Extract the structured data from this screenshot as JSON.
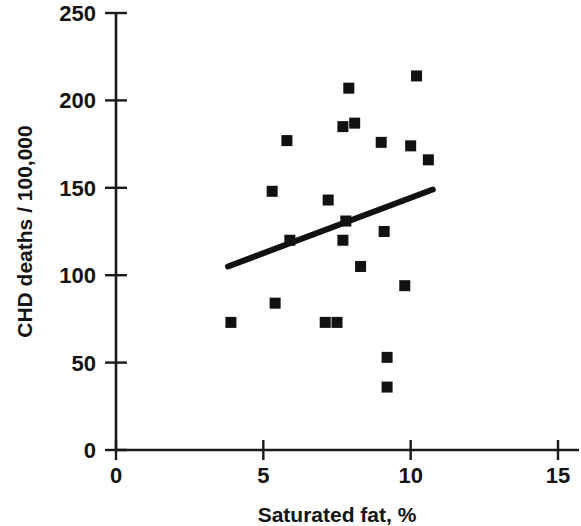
{
  "chart_data": {
    "type": "scatter",
    "title": "",
    "xlabel": "Saturated fat, %",
    "ylabel": "CHD deaths / 100,000",
    "xlim": [
      0,
      15
    ],
    "ylim": [
      0,
      250
    ],
    "xticks": [
      0,
      5,
      10,
      15
    ],
    "yticks": [
      0,
      50,
      100,
      150,
      200,
      250
    ],
    "xtick_labels": [
      "0",
      "5",
      "10",
      "15"
    ],
    "ytick_labels": [
      "0",
      "50",
      "100",
      "150",
      "200",
      "250"
    ],
    "grid": false,
    "legend": null,
    "marker": "square",
    "marker_color": "#111111",
    "points": [
      {
        "x": 3.9,
        "y": 73
      },
      {
        "x": 5.3,
        "y": 148
      },
      {
        "x": 5.4,
        "y": 84
      },
      {
        "x": 5.8,
        "y": 177
      },
      {
        "x": 5.9,
        "y": 120
      },
      {
        "x": 7.1,
        "y": 73
      },
      {
        "x": 7.2,
        "y": 143
      },
      {
        "x": 7.5,
        "y": 73
      },
      {
        "x": 7.7,
        "y": 185
      },
      {
        "x": 7.7,
        "y": 120
      },
      {
        "x": 7.8,
        "y": 131
      },
      {
        "x": 7.9,
        "y": 207
      },
      {
        "x": 8.1,
        "y": 187
      },
      {
        "x": 8.3,
        "y": 105
      },
      {
        "x": 9.0,
        "y": 176
      },
      {
        "x": 9.1,
        "y": 125
      },
      {
        "x": 9.2,
        "y": 53
      },
      {
        "x": 9.2,
        "y": 36
      },
      {
        "x": 9.8,
        "y": 94
      },
      {
        "x": 10.0,
        "y": 174
      },
      {
        "x": 10.2,
        "y": 214
      },
      {
        "x": 10.6,
        "y": 166
      }
    ],
    "trend_line": {
      "type": "linear-fit",
      "x_start": 3.8,
      "y_start": 105,
      "x_end": 10.75,
      "y_end": 149,
      "color": "#111111"
    }
  }
}
